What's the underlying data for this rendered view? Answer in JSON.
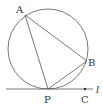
{
  "diagram": {
    "type": "geometry",
    "circle": {
      "cx": 48,
      "cy": 49,
      "r": 40
    },
    "points": {
      "A": {
        "label": "A",
        "x": 25,
        "y": 15
      },
      "B": {
        "label": "B",
        "x": 87,
        "y": 61
      },
      "P": {
        "label": "P",
        "x": 48,
        "y": 89
      },
      "C": {
        "label": "C",
        "x": 85,
        "y": 89
      }
    },
    "segments": [
      [
        "A",
        "P"
      ],
      [
        "A",
        "B"
      ],
      [
        "P",
        "B"
      ]
    ],
    "line": {
      "label": "l",
      "y": 89,
      "x1": 6,
      "x2": 93
    },
    "colors": {
      "stroke": "#555555",
      "text": "#333333"
    }
  }
}
